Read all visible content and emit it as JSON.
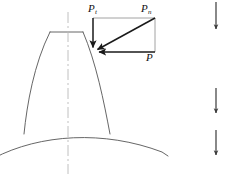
{
  "figure": {
    "width": 228,
    "height": 174
  },
  "colors": {
    "background": "#ffffff",
    "tooth_outline": "#555555",
    "root_arc": "#555555",
    "centerline": "#b9b9b9",
    "force_vector": "#1a1a1a",
    "construction_line": "#8c8c8c",
    "label_text": "#111111",
    "partial_arrow": "#3a3a3a"
  },
  "labels": {
    "tangential": {
      "base": "P",
      "sub": "t"
    },
    "normal": {
      "base": "P",
      "sub": "n"
    },
    "radial": {
      "base": "P",
      "sub": ""
    }
  },
  "geometry": {
    "contact_point": {
      "x": 93,
      "y": 52
    },
    "force_rectangle": {
      "left": 93,
      "top": 18,
      "right": 155,
      "bottom": 52
    },
    "tooth": {
      "tip_left": {
        "x": 50,
        "y": 32
      },
      "tip_right": {
        "x": 83,
        "y": 32
      },
      "root_left": {
        "x": 24,
        "y": 134
      },
      "root_right": {
        "x": 110,
        "y": 134
      }
    },
    "centerline_x": 68,
    "root_arc_apex": {
      "x": 100,
      "y": 136
    }
  },
  "vectors": [
    {
      "name": "normal-force",
      "symbol": "Pn",
      "from": {
        "x": 155,
        "y": 18
      },
      "to": {
        "x": 96,
        "y": 50
      },
      "direction": "diagonal down-left",
      "role": "resultant normal load on tooth flank"
    },
    {
      "name": "tangential-force",
      "symbol": "Pt",
      "from": {
        "x": 93,
        "y": 18
      },
      "to": {
        "x": 93,
        "y": 48
      },
      "direction": "downward vertical",
      "role": "tangential component"
    },
    {
      "name": "radial-force",
      "symbol": "P",
      "from": {
        "x": 155,
        "y": 52
      },
      "to": {
        "x": 98,
        "y": 52
      },
      "direction": "leftward horizontal",
      "role": "radial component"
    }
  ],
  "partial_arrows": [
    {
      "name": "partial-arrow-top",
      "x": 216,
      "top": 2,
      "bottom": 32
    },
    {
      "name": "partial-arrow-middle",
      "x": 216,
      "top": 88,
      "bottom": 116
    },
    {
      "name": "partial-arrow-bottom",
      "x": 216,
      "top": 130,
      "bottom": 158
    }
  ]
}
